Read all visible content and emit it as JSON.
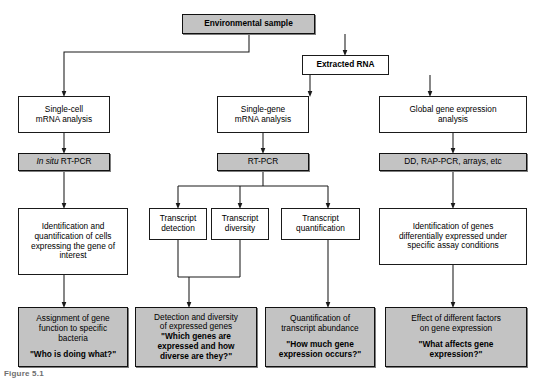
{
  "figure": {
    "caption": "Figure 5.1",
    "colors": {
      "shaded_fill": "#c3c3c3",
      "plain_fill": "#ffffff",
      "stroke": "#1a1a1a"
    }
  },
  "nodes": {
    "environmental_sample": {
      "label": "Environmental sample",
      "style": "shaded-bold"
    },
    "extracted_rna": {
      "label": "Extracted RNA",
      "style": "plain-bold"
    },
    "single_cell": {
      "line1": "Single-cell",
      "line2": "mRNA analysis"
    },
    "single_gene": {
      "line1": "Single-gene",
      "line2": "mRNA analysis"
    },
    "global_expr": {
      "line1": "Global gene expression",
      "line2": "analysis"
    },
    "in_situ_rtpcr": {
      "italic_part": "In situ",
      "plain_part": " RT-PCR"
    },
    "rtpcr": {
      "label": "RT-PCR"
    },
    "dd_rappcr": {
      "label": "DD, RAP-PCR, arrays, etc"
    },
    "identification_cells": {
      "line1": "Identification and",
      "line2": "quantification of cells",
      "line3": "expressing the gene of",
      "line4": "interest"
    },
    "transcript_detection": {
      "line1": "Transcript",
      "line2": "detection"
    },
    "transcript_diversity": {
      "line1": "Transcript",
      "line2": "diversity"
    },
    "transcript_quantification": {
      "line1": "Transcript",
      "line2": "quantification"
    },
    "identification_genes": {
      "line1": "Identification of genes",
      "line2": "differentially expressed under",
      "line3": "specific assay conditions"
    },
    "assignment_gene": {
      "line1": "Assignment of gene",
      "line2": "function to specific",
      "line3": "bacteria",
      "question": "\"Who is doing what?\""
    },
    "detection_diversity": {
      "line1": "Detection and diversity",
      "line2": "of expressed genes",
      "question1": "\"Which genes are",
      "question2": "expressed and how",
      "question3": "diverse are they?\""
    },
    "quantification_transcript": {
      "line1": "Quantification of",
      "line2": "transcript abundance",
      "question1": "\"How much gene",
      "question2": "expression occurs?\""
    },
    "effect_factors": {
      "line1": "Effect of different factors",
      "line2": "on gene expression",
      "question1": "\"What affects gene",
      "question2": "expression?\""
    }
  }
}
